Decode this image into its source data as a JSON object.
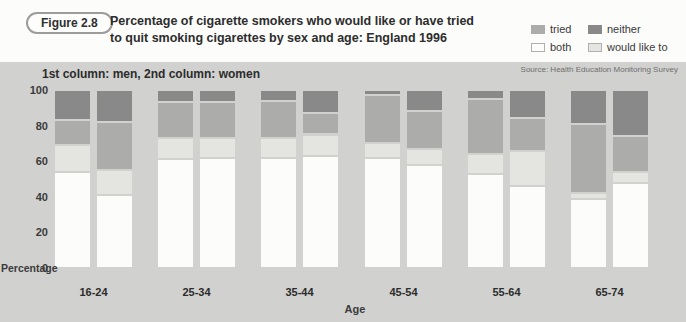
{
  "figure_label": "Figure 2.8",
  "title_line1": "Percentage of cigarette smokers who would like or have tried",
  "title_line2": "to quit smoking cigarettes by sex and age: England 1996",
  "subtitle": "1st column: men, 2nd column: women",
  "source": "Source: Health Education Monitoring Survey",
  "colors": {
    "tried": "#acacab",
    "neither": "#898989",
    "both": "#fcfcfb",
    "would_like_to": "#e4e4e1",
    "panel_bg": "#d1d1cf",
    "header_bg": "#fcfcfb",
    "text": "#2e2e2e"
  },
  "legend": [
    {
      "key": "tried",
      "label": "tried"
    },
    {
      "key": "neither",
      "label": "neither"
    },
    {
      "key": "both",
      "label": "both"
    },
    {
      "key": "would_like_to",
      "label": "would like to"
    }
  ],
  "chart_data": {
    "type": "bar",
    "stacked": true,
    "title": "Percentage of cigarette smokers who would like or have tried to quit smoking cigarettes by sex and age: England 1996",
    "xlabel": "Age",
    "ylabel": "Percentage",
    "ylim": [
      0,
      100
    ],
    "yticks": [
      100,
      80,
      60,
      40,
      20,
      0
    ],
    "grid": false,
    "legend_position": "top-right",
    "categories": [
      "16-24",
      "25-34",
      "35-44",
      "45-54",
      "55-64",
      "65-74"
    ],
    "segment_order_bottom_to_top": [
      "both",
      "would_like_to",
      "tried",
      "neither"
    ],
    "series": [
      {
        "name": "men",
        "segments": {
          "both": [
            54,
            61,
            62,
            62,
            53,
            39
          ],
          "would_like_to": [
            15,
            12,
            11,
            8,
            11,
            3
          ],
          "tried": [
            14,
            20,
            21,
            27,
            31,
            39
          ],
          "neither": [
            17,
            7,
            6,
            3,
            5,
            19
          ]
        }
      },
      {
        "name": "women",
        "segments": {
          "both": [
            41,
            62,
            63,
            58,
            46,
            48
          ],
          "would_like_to": [
            14,
            11,
            12,
            9,
            20,
            6
          ],
          "tried": [
            27,
            20,
            12,
            21,
            18,
            20
          ],
          "neither": [
            18,
            7,
            13,
            12,
            16,
            26
          ]
        }
      }
    ]
  }
}
